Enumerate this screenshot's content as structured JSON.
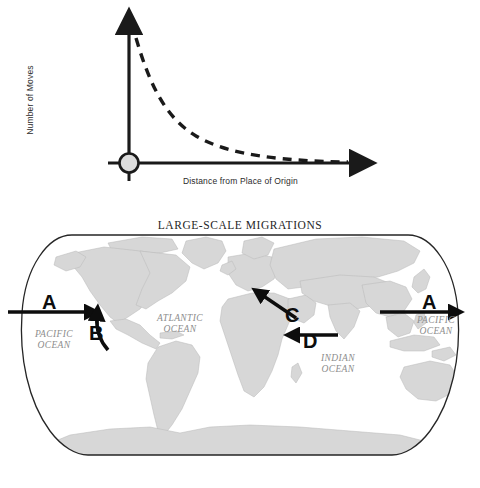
{
  "figure": {
    "graph": {
      "name": "distance-decay-graph",
      "y_axis_label": "Number of Moves",
      "x_axis_label": "Distance from Place of Origin",
      "origin_marker": "origin-circle",
      "curve_style": "dashed",
      "curve_color": "#1a1a1a",
      "axis_color": "#1a1a1a",
      "origin_fill": "#d9d9d9"
    },
    "map": {
      "name": "world-migration-map",
      "title": "LARGE-SCALE MIGRATIONS",
      "projection": "robinson",
      "land_color": "#d9d9d9",
      "ocean_color": "#ffffff",
      "border_color": "#262626",
      "ocean_labels": [
        {
          "id": "pacific-west",
          "text": "PACIFIC\nOCEAN"
        },
        {
          "id": "atlantic",
          "text": "ATLANTIC\nOCEAN"
        },
        {
          "id": "indian",
          "text": "INDIAN\nOCEAN"
        },
        {
          "id": "pacific-east",
          "text": "PACIFIC\nOCEAN"
        }
      ],
      "migration_arrows": [
        {
          "id": "arrow-a-west",
          "label": "A",
          "direction": "eastward",
          "region": "eastern-pacific-to-north-america"
        },
        {
          "id": "arrow-b",
          "label": "B",
          "direction": "northward",
          "region": "mexico-to-western-united-states"
        },
        {
          "id": "arrow-c",
          "label": "C",
          "direction": "northwestward",
          "region": "middle-east-to-europe"
        },
        {
          "id": "arrow-d",
          "label": "D",
          "direction": "westward",
          "region": "south-asia-to-arabian-peninsula"
        },
        {
          "id": "arrow-a-east",
          "label": "A",
          "direction": "eastward",
          "region": "east-asia-to-western-pacific"
        }
      ]
    }
  }
}
